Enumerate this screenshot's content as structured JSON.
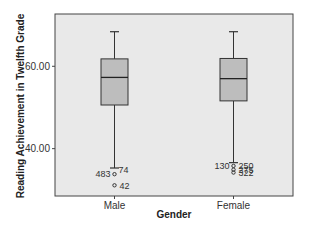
{
  "chart_data": {
    "type": "boxplot",
    "title": "",
    "xlabel": "Gender",
    "ylabel": "Reading Achievement in Twelfth Grade",
    "ylim": [
      28.5,
      72.7
    ],
    "yticks": [
      {
        "value": 40,
        "label": "40.00"
      },
      {
        "value": 60,
        "label": "60.00"
      }
    ],
    "grid": false,
    "legend": "none",
    "colors": {
      "plot_background": "#e9e9e9",
      "box_fill": "#bdbdbd",
      "line": "#333333",
      "frame": "#444444"
    },
    "categories": [
      "Male",
      "Female"
    ],
    "series": [
      {
        "name": "Male",
        "whisker_low": 35.3,
        "q1": 50.6,
        "median": 57.3,
        "q3": 61.8,
        "whisker_high": 68.4,
        "outliers": [
          {
            "value": 33.8,
            "label": "74",
            "label_side": "right-up"
          },
          {
            "value": 33.8,
            "label": "483",
            "label_side": "left"
          },
          {
            "value": 31.1,
            "label": "42",
            "label_side": "right"
          }
        ]
      },
      {
        "name": "Female",
        "whisker_low": 36.6,
        "q1": 51.6,
        "median": 57.0,
        "q3": 61.9,
        "whisker_high": 68.4,
        "outliers": [
          {
            "value": 35.8,
            "label": "250",
            "label_side": "right"
          },
          {
            "value": 35.8,
            "label": "130",
            "label_side": "left"
          },
          {
            "value": 34.9,
            "label": "275",
            "label_side": "right"
          },
          {
            "value": 34.2,
            "label": "322",
            "label_side": "right"
          }
        ]
      }
    ]
  }
}
